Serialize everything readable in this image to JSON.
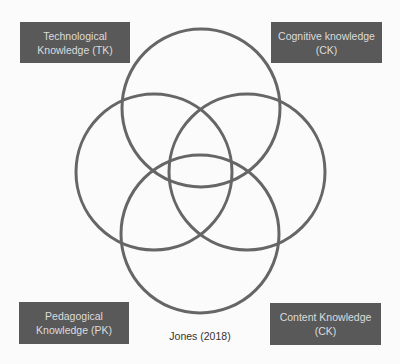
{
  "diagram": {
    "type": "venn",
    "title": "",
    "labels": {
      "top_left": {
        "line1": "Technological",
        "line2": "Knowledge (TK)"
      },
      "top_right": {
        "line1": "Cognitive knowledge",
        "line2": "(CK)"
      },
      "bottom_left": {
        "line1": "Pedagogical",
        "line2": "Knowledge (PK)"
      },
      "bottom_right": {
        "line1": "Content Knowledge",
        "line2": "(CK)"
      }
    },
    "caption": "Jones (2018)",
    "circles": [
      {
        "name": "top",
        "cx": 201,
        "cy": 108,
        "r": 79
      },
      {
        "name": "left",
        "cx": 154,
        "cy": 172,
        "r": 78
      },
      {
        "name": "right",
        "cx": 247,
        "cy": 172,
        "r": 78
      },
      {
        "name": "bottom",
        "cx": 200,
        "cy": 234,
        "r": 79
      }
    ],
    "colors": {
      "circle_stroke": "#666666",
      "box_fill": "#595959",
      "box_text": "#dcdcdc",
      "background": "#fbfbfb"
    }
  }
}
